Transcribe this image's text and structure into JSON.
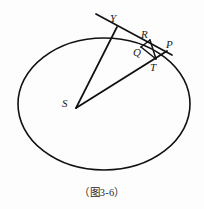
{
  "figure": {
    "caption": "（图3-6）",
    "background_color": "#fdfdfd",
    "stroke_color": "#111111",
    "labels": {
      "Y": "Y",
      "R": "R",
      "P": "P",
      "Q": "Q",
      "T": "T",
      "S": "S"
    },
    "icon_names": {
      "ellipse": "ellipse-curve-icon",
      "tangent": "tangent-line-icon",
      "ray_upper": "ray-s-to-y-icon",
      "ray_lower": "ray-s-to-p-icon",
      "chord_qr": "segment-q-r-icon",
      "chord_qt": "segment-q-t-icon",
      "chord_rt": "segment-r-t-icon"
    },
    "geometry": {
      "ellipse": {
        "cx": 104,
        "cy": 104,
        "rx": 86,
        "ry": 66
      },
      "points": {
        "S": {
          "x": 76,
          "y": 108
        },
        "Y": {
          "x": 117,
          "y": 27
        },
        "R": {
          "x": 148,
          "y": 42
        },
        "P": {
          "x": 165,
          "y": 50
        },
        "Q": {
          "x": 142,
          "y": 46
        },
        "T": {
          "x": 155,
          "y": 60
        },
        "tangent_start": {
          "x": 96,
          "y": 14
        },
        "tangent_end": {
          "x": 172,
          "y": 55
        }
      }
    }
  }
}
